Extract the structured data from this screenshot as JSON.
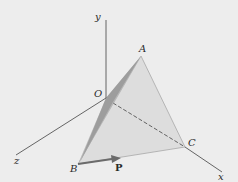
{
  "figure": {
    "background": "#ededed",
    "axes": {
      "x": {
        "label": "x"
      },
      "y": {
        "label": "y"
      },
      "z": {
        "label": "z"
      }
    },
    "points": {
      "O": {
        "label": "O"
      },
      "A": {
        "label": "A"
      },
      "B": {
        "label": "B"
      },
      "C": {
        "label": "C"
      }
    },
    "force": {
      "label": "P",
      "color": "#6b6b6b"
    },
    "colors": {
      "axis": "#555555",
      "face_light": "#d9d9d9",
      "face_dark": "#9a9a9a",
      "edge": "#a8a8a8"
    }
  }
}
